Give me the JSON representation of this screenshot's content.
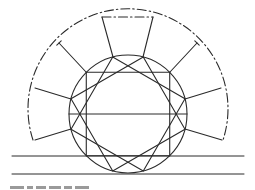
{
  "figure": {
    "stroke_color": "#2a2a2a",
    "background": "#ffffff",
    "center": [
      128,
      114
    ],
    "inner_radius": 59,
    "outer_radius": 100,
    "outer_arc": {
      "start": [
        33,
        140
      ],
      "end": [
        223,
        140
      ],
      "style": "dash-dot"
    },
    "horizontal_lines": [
      {
        "y": 156,
        "x1": 12,
        "x2": 244
      },
      {
        "y": 174,
        "x1": 12,
        "x2": 244
      }
    ],
    "diameter_line": {
      "y": 114,
      "x1": 69,
      "x2": 187
    },
    "square_vertex_angles_deg": [
      [
        45,
        135,
        225,
        315
      ],
      [
        15,
        105,
        195,
        285
      ],
      [
        75,
        165,
        255,
        345
      ]
    ],
    "spokes": [
      {
        "from": [
          113,
          57
        ],
        "to": [
          102,
          17
        ]
      },
      {
        "from": [
          143,
          57
        ],
        "to": [
          153,
          17
        ]
      },
      {
        "from": [
          86,
          72
        ],
        "to": [
          59,
          43
        ],
        "tick": true
      },
      {
        "from": [
          170,
          72
        ],
        "to": [
          197,
          43
        ],
        "tick": true
      },
      {
        "from": [
          71,
          99
        ],
        "to": [
          35,
          88
        ]
      },
      {
        "from": [
          185,
          99
        ],
        "to": [
          221,
          88
        ]
      },
      {
        "from": [
          71,
          129
        ],
        "to": [
          35,
          140
        ]
      },
      {
        "from": [
          185,
          129
        ],
        "to": [
          222,
          140
        ]
      }
    ],
    "top_chord": {
      "from": [
        102,
        17
      ],
      "to": [
        153,
        17
      ]
    },
    "caption_visible": false
  }
}
